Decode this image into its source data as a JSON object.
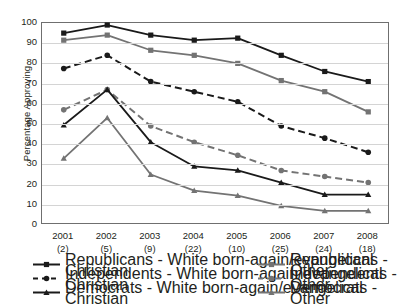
{
  "chart_data": {
    "type": "line",
    "title": "",
    "xlabel": "",
    "ylabel": "Percentage Approving",
    "ylim": [
      0,
      100
    ],
    "ytick_step": 10,
    "grid": true,
    "legend_position": "bottom",
    "categories": [
      "2001",
      "2002",
      "2003",
      "2004",
      "2005",
      "2006",
      "2007",
      "2008"
    ],
    "category_counts": [
      "(2)",
      "(5)",
      "(9)",
      "(22)",
      "(10)",
      "(25)",
      "(24)",
      "(18)"
    ],
    "yticks": [
      "0",
      "10",
      "20",
      "30",
      "40",
      "50",
      "60",
      "70",
      "80",
      "90",
      "100"
    ],
    "series": [
      {
        "name": "Republicans - White born-again/evangelical Christian",
        "key": "rep-evangelical",
        "color": "#1a1a1a",
        "marker": "square",
        "dash": "solid",
        "values": [
          95,
          99,
          94,
          91.5,
          92.5,
          84,
          76,
          71
        ]
      },
      {
        "name": "Republicans - Other",
        "key": "rep-other",
        "color": "#737373",
        "marker": "square",
        "dash": "solid",
        "values": [
          91.5,
          94,
          86.5,
          84,
          80,
          71.5,
          66,
          56
        ]
      },
      {
        "name": "Independents - White born-again/evangelical Christian",
        "key": "ind-evangelical",
        "color": "#1a1a1a",
        "marker": "circle",
        "dash": "dashed",
        "values": [
          77.5,
          84,
          71,
          66,
          61,
          49,
          43,
          36
        ]
      },
      {
        "name": "Independents - Other",
        "key": "ind-other",
        "color": "#737373",
        "marker": "circle",
        "dash": "dashed",
        "values": [
          57,
          67,
          49,
          41,
          34.5,
          27,
          24,
          21
        ]
      },
      {
        "name": "Democrats - White born-again/evangelical Christian",
        "key": "dem-evangelical",
        "color": "#1a1a1a",
        "marker": "triangle",
        "dash": "solid",
        "values": [
          49.5,
          67,
          41,
          29,
          27,
          21,
          15,
          15
        ]
      },
      {
        "name": "Democrats - Other",
        "key": "dem-other",
        "color": "#737373",
        "marker": "triangle",
        "dash": "solid",
        "values": [
          33,
          53,
          25,
          17,
          14.5,
          9.5,
          7,
          7
        ]
      }
    ]
  },
  "legend": {
    "column_left": [
      "Republicans - White born-again/evangelical Christian",
      "Independents - White born-again/evangelical Christian",
      "Democrats - White born-again/evangelical Christian"
    ],
    "column_right": [
      "Republicans - Other",
      "Independents - Other",
      "Democrats - Other"
    ]
  },
  "axis": {
    "y_title": "Percentage Approving"
  }
}
